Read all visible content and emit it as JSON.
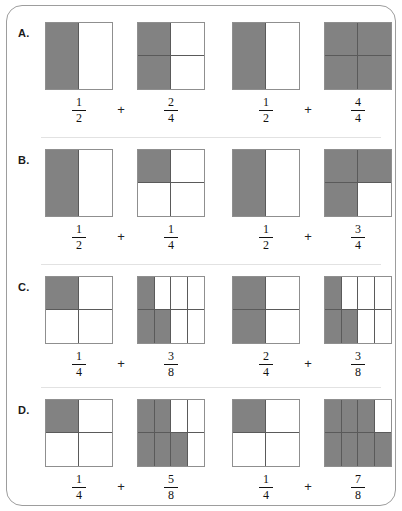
{
  "worksheet": {
    "title": "Fraction Addition Model Worksheet",
    "shaded_color": "#828282",
    "unshaded_color": "#ffffff",
    "grid_line_color": "#5a5a5a",
    "border_color": "#9d9d9d",
    "plus_symbol": "+"
  },
  "rows": [
    {
      "label": "A.",
      "pairs": [
        {
          "left": {
            "numerator": "1",
            "denominator": "2",
            "model": "halves",
            "cells": [
              1,
              0
            ]
          },
          "operator": "+",
          "right": {
            "numerator": "2",
            "denominator": "4",
            "model": "quarters",
            "cells": [
              1,
              0,
              1,
              0
            ]
          }
        },
        {
          "left": {
            "numerator": "1",
            "denominator": "2",
            "model": "halves",
            "cells": [
              1,
              0
            ]
          },
          "operator": "+",
          "right": {
            "numerator": "4",
            "denominator": "4",
            "model": "quarters",
            "cells": [
              1,
              1,
              1,
              1
            ]
          }
        }
      ]
    },
    {
      "label": "B.",
      "pairs": [
        {
          "left": {
            "numerator": "1",
            "denominator": "2",
            "model": "halves",
            "cells": [
              1,
              0
            ]
          },
          "operator": "+",
          "right": {
            "numerator": "1",
            "denominator": "4",
            "model": "quarters",
            "cells": [
              1,
              0,
              0,
              0
            ]
          }
        },
        {
          "left": {
            "numerator": "1",
            "denominator": "2",
            "model": "halves",
            "cells": [
              1,
              0
            ]
          },
          "operator": "+",
          "right": {
            "numerator": "3",
            "denominator": "4",
            "model": "quarters",
            "cells": [
              1,
              1,
              1,
              0
            ]
          }
        }
      ]
    },
    {
      "label": "C.",
      "pairs": [
        {
          "left": {
            "numerator": "1",
            "denominator": "4",
            "model": "quarters",
            "cells": [
              1,
              0,
              0,
              0
            ]
          },
          "operator": "+",
          "right": {
            "numerator": "3",
            "denominator": "8",
            "model": "eighths",
            "cells": [
              1,
              0,
              0,
              0,
              1,
              1,
              0,
              0
            ]
          }
        },
        {
          "left": {
            "numerator": "2",
            "denominator": "4",
            "model": "quarters",
            "cells": [
              1,
              0,
              1,
              0
            ]
          },
          "operator": "+",
          "right": {
            "numerator": "3",
            "denominator": "8",
            "model": "eighths",
            "cells": [
              1,
              0,
              0,
              0,
              1,
              1,
              0,
              0
            ]
          }
        }
      ]
    },
    {
      "label": "D.",
      "pairs": [
        {
          "left": {
            "numerator": "1",
            "denominator": "4",
            "model": "quarters",
            "cells": [
              1,
              0,
              0,
              0
            ]
          },
          "operator": "+",
          "right": {
            "numerator": "5",
            "denominator": "8",
            "model": "eighths",
            "cells": [
              1,
              1,
              0,
              0,
              1,
              1,
              1,
              0
            ]
          }
        },
        {
          "left": {
            "numerator": "1",
            "denominator": "4",
            "model": "quarters",
            "cells": [
              1,
              0,
              0,
              0
            ]
          },
          "operator": "+",
          "right": {
            "numerator": "7",
            "denominator": "8",
            "model": "eighths",
            "cells": [
              1,
              1,
              1,
              0,
              1,
              1,
              1,
              1
            ]
          }
        }
      ]
    }
  ]
}
